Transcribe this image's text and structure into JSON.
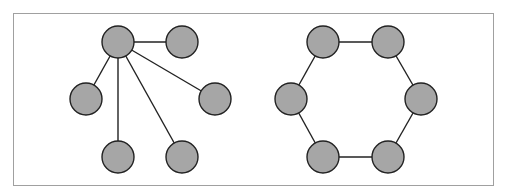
{
  "colors": {
    "node_fill": "#a6a6a6",
    "stroke": "#222222",
    "frame": "#a0a0a0"
  },
  "node_radius": 16,
  "graphs": [
    {
      "name": "star",
      "nodes": [
        {
          "id": "hub",
          "x": 118,
          "y": 42
        },
        {
          "id": "n1",
          "x": 182,
          "y": 42
        },
        {
          "id": "n2",
          "x": 86,
          "y": 99
        },
        {
          "id": "n3",
          "x": 215,
          "y": 99
        },
        {
          "id": "n4",
          "x": 118,
          "y": 157
        },
        {
          "id": "n5",
          "x": 182,
          "y": 157
        }
      ],
      "edges": [
        [
          "hub",
          "n1"
        ],
        [
          "hub",
          "n2"
        ],
        [
          "hub",
          "n3"
        ],
        [
          "hub",
          "n4"
        ],
        [
          "hub",
          "n5"
        ]
      ]
    },
    {
      "name": "hexagon-cycle",
      "nodes": [
        {
          "id": "a",
          "x": 323,
          "y": 42
        },
        {
          "id": "b",
          "x": 388,
          "y": 42
        },
        {
          "id": "c",
          "x": 421,
          "y": 99
        },
        {
          "id": "d",
          "x": 388,
          "y": 157
        },
        {
          "id": "e",
          "x": 323,
          "y": 157
        },
        {
          "id": "f",
          "x": 291,
          "y": 99
        }
      ],
      "edges": [
        [
          "a",
          "b"
        ],
        [
          "b",
          "c"
        ],
        [
          "c",
          "d"
        ],
        [
          "d",
          "e"
        ],
        [
          "e",
          "f"
        ],
        [
          "f",
          "a"
        ]
      ]
    }
  ]
}
